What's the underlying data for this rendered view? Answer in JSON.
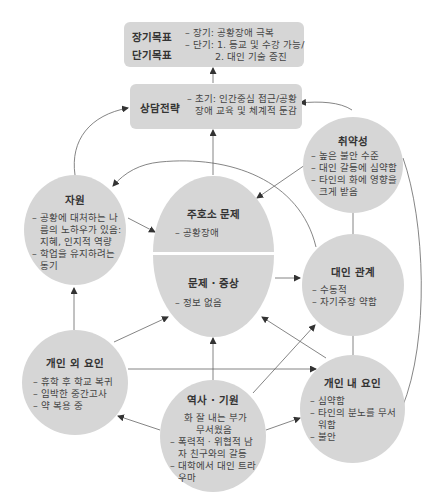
{
  "goals": {
    "title_long": "장기목표",
    "title_short": "단기목표",
    "items": [
      "– 장기: 공황장애 극복",
      "– 단기: 1. 등교 및 수강 가능/",
      "2. 대인 기술 증진"
    ]
  },
  "strategy": {
    "title": "상담전략",
    "items": [
      "– 초기: 인간중심 접근/공황",
      "장애 교육 및 체계적 둔감"
    ]
  },
  "vulnerability": {
    "title": "취약성",
    "items": [
      "– 높은 불안 수준",
      "– 대인 갈등에 심약함",
      "– 타인의 화에 영향을",
      "크게 받음"
    ]
  },
  "resources": {
    "title": "자원",
    "items": [
      "– 공황에 대처하는 나",
      "름의 노하우가 있음:",
      "지혜, 인지적 역량",
      "– 학업을 유지하려는",
      "동기"
    ]
  },
  "chief_complaint": {
    "title": "주호소 문제",
    "items": [
      "– 공황장애"
    ]
  },
  "problem_symptom": {
    "title": "문제 · 증상",
    "items": [
      "– 정보 없음"
    ]
  },
  "interpersonal": {
    "title": "대인 관계",
    "items": [
      "– 수동적",
      "– 자기주장 약함"
    ]
  },
  "external_factors": {
    "title": "개인 외 요인",
    "items": [
      "– 휴학 후 학교 복귀",
      "– 임박한 중간고사",
      "– 약 복용 중"
    ]
  },
  "history": {
    "title": "역사 · 기원",
    "items": [
      "화 잘 내는 부가",
      "무서웠음",
      "– 폭력적 · 위협적 남",
      "자 친구와의 갈등",
      "– 대학에서 대인 트라",
      "우마"
    ]
  },
  "internal_factors": {
    "title": "개인 내 요인",
    "items": [
      "– 심약함",
      "– 타인의 분노를 무서",
      "워함",
      "– 불안"
    ]
  },
  "colors": {
    "node_fill": "#d6d6d6",
    "line": "#555555",
    "background": "#ffffff"
  }
}
